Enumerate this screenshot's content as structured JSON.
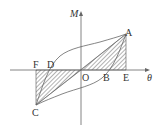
{
  "diagram": {
    "type": "hysteresis-loop",
    "axes": {
      "y_label": "M",
      "x_label": "θ"
    },
    "points": {
      "A": "A",
      "B": "B",
      "C": "C",
      "D": "D",
      "E": "E",
      "F": "F",
      "O": "O"
    },
    "shaded_regions": [
      "triangle O-A-E",
      "triangle O-C-F"
    ],
    "colors": {
      "line": "#555555",
      "hatch": "#555555",
      "background": "#ffffff"
    }
  }
}
